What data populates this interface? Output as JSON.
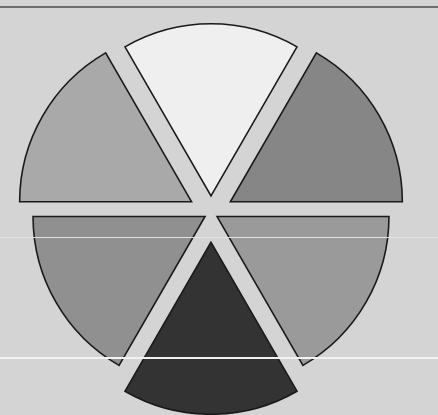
{
  "figure": {
    "background_color": "#d4d4d4",
    "width": 438,
    "height": 415,
    "title": "",
    "outline_color": "#1a1a1a",
    "outline_width": 1.6
  },
  "artifacts": {
    "top_rule": {
      "name": "top-dark-rule",
      "y": 6,
      "height": 2,
      "color": "#6e6e6e"
    },
    "mid_rule": {
      "name": "mid-light-rule",
      "y": 237,
      "height": 1,
      "color": "#e2e2e2"
    },
    "low_rule": {
      "name": "low-light-rule",
      "y": 357,
      "height": 2,
      "color": "#f2f2f2"
    }
  },
  "chart_data": {
    "type": "pie",
    "title": "",
    "subtitle": "",
    "xlabel": "",
    "ylabel": "",
    "legend": [],
    "legend_position": "none",
    "grid": false,
    "exploded": true,
    "center_x": 211,
    "center_y": 213,
    "radius": 172,
    "start_angle_deg": 90,
    "direction": "counterclockwise",
    "categories": [
      "Slice 1",
      "Slice 2",
      "Slice 3",
      "Slice 4",
      "Slice 5",
      "Slice 6"
    ],
    "values": [
      1,
      1,
      1,
      1,
      1,
      1
    ],
    "percentages": [
      "16.7%",
      "16.7%",
      "16.7%",
      "16.7%",
      "16.7%",
      "16.7%"
    ],
    "slices": [
      {
        "label": "Slice 1",
        "value": 1,
        "percent": 16.7,
        "start_deg": 60,
        "end_deg": 120,
        "mid_deg": 90,
        "color": "#efefef",
        "explode": 0.1,
        "position": "top"
      },
      {
        "label": "Slice 2",
        "value": 1,
        "percent": 16.7,
        "start_deg": 0,
        "end_deg": 60,
        "mid_deg": 30,
        "color": "#868686",
        "explode": 0.13,
        "position": "upper-right"
      },
      {
        "label": "Slice 3",
        "value": 1,
        "percent": 16.7,
        "start_deg": 300,
        "end_deg": 360,
        "mid_deg": 330,
        "color": "#9a9a9a",
        "explode": 0.04,
        "position": "lower-right"
      },
      {
        "label": "Slice 4",
        "value": 1,
        "percent": 16.7,
        "start_deg": 240,
        "end_deg": 300,
        "mid_deg": 270,
        "color": "#333333",
        "explode": 0.17,
        "position": "bottom"
      },
      {
        "label": "Slice 5",
        "value": 1,
        "percent": 16.7,
        "start_deg": 180,
        "end_deg": 240,
        "mid_deg": 210,
        "color": "#909090",
        "explode": 0.04,
        "position": "lower-left"
      },
      {
        "label": "Slice 6",
        "value": 1,
        "percent": 16.7,
        "start_deg": 120,
        "end_deg": 180,
        "mid_deg": 150,
        "color": "#a9a9a9",
        "explode": 0.13,
        "position": "upper-left"
      }
    ]
  }
}
